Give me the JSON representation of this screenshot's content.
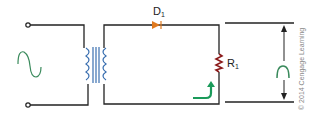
{
  "diagram": {
    "components": {
      "source": {
        "symbol": "ac-sine-wave",
        "color": "#3a8a5c"
      },
      "transformer": {
        "color": "#3a6fb0"
      },
      "diode": {
        "label": "D",
        "subscript": "1",
        "color": "#e07a1f"
      },
      "resistor": {
        "label": "R",
        "subscript": "1",
        "color": "#8b1a1a"
      },
      "current_arrow": {
        "color": "#1a9a5a"
      },
      "output_waveform": {
        "symbol": "half-wave-pulse",
        "color": "#3a8a5c"
      }
    },
    "credit": "© 2014 Cengage Learning"
  }
}
